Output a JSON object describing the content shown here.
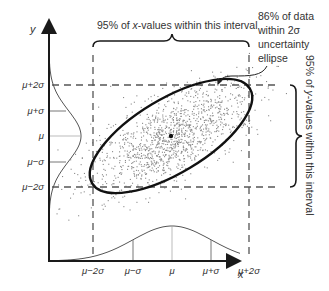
{
  "axes": {
    "x_label": "x",
    "y_label": "y"
  },
  "x_ticks": [
    {
      "label": "μ−2σ",
      "x": 93
    },
    {
      "label": "μ−σ",
      "x": 133
    },
    {
      "label": "μ",
      "x": 172
    },
    {
      "label": "μ+σ",
      "x": 211
    },
    {
      "label": "μ+2σ",
      "x": 249
    }
  ],
  "y_ticks": [
    {
      "label": "μ+2σ",
      "y": 85
    },
    {
      "label": "μ+σ",
      "y": 111
    },
    {
      "label": "μ",
      "y": 136
    },
    {
      "label": "μ−σ",
      "y": 162
    },
    {
      "label": "μ−2σ",
      "y": 187
    }
  ],
  "annotations": {
    "x_interval": "95% of x-values within this interval",
    "x_interval_parts": [
      "95% of ",
      "x",
      "-values within this interval"
    ],
    "y_interval": "95% of y-values within this interval",
    "y_interval_parts": [
      "95% of ",
      "y",
      "-values within this interval"
    ],
    "ellipse_note_lines": [
      "86% of data",
      "within 2σ",
      "uncertainty",
      "ellipse"
    ]
  },
  "colors": {
    "axis": "#1a1a1a",
    "curve": "#555555",
    "scatter": "#888888",
    "ellipse": "#111111",
    "dash": "#555555",
    "text": "#333333"
  }
}
